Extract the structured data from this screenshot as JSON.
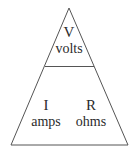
{
  "diagram": {
    "name": "ohms-law-triangle",
    "shape": "triangle",
    "background_color": "#ffffff",
    "line_color": "#555555",
    "text_color": "#2b2b2b",
    "geometry": {
      "apex": [
        69,
        8
      ],
      "bottom_left": [
        11,
        145
      ],
      "bottom_right": [
        128,
        145
      ],
      "divider_y": 66,
      "divider_x_start": 45,
      "divider_x_end": 94
    },
    "cells": [
      {
        "id": "voltage",
        "position": "top",
        "symbol": "V",
        "unit": "volts"
      },
      {
        "id": "current",
        "position": "bottom-left",
        "symbol": "I",
        "unit": "amps"
      },
      {
        "id": "resistance",
        "position": "bottom-right",
        "symbol": "R",
        "unit": "ohms"
      }
    ]
  }
}
